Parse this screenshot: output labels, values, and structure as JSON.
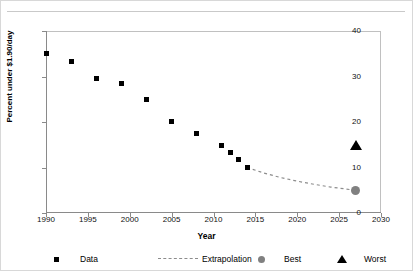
{
  "chart_data": {
    "type": "scatter",
    "title": "",
    "xlabel": "Year",
    "ylabel": "Percent under $1.90/day",
    "xlim": [
      1990,
      2030
    ],
    "ylim": [
      0,
      40
    ],
    "xticks": [
      1990,
      1995,
      2000,
      2005,
      2010,
      2015,
      2020,
      2025,
      2030
    ],
    "yticks": [
      0,
      10,
      20,
      30,
      40
    ],
    "grid": false,
    "legend_position": "bottom",
    "series": [
      {
        "name": "Data",
        "marker": "square",
        "color": "#000000",
        "points": [
          {
            "x": 1990,
            "y": 35.1
          },
          {
            "x": 1993,
            "y": 33.3
          },
          {
            "x": 1996,
            "y": 29.6
          },
          {
            "x": 1999,
            "y": 28.4
          },
          {
            "x": 2002,
            "y": 24.9
          },
          {
            "x": 2005,
            "y": 20.2
          },
          {
            "x": 2008,
            "y": 17.4
          },
          {
            "x": 2011,
            "y": 14.9
          },
          {
            "x": 2012,
            "y": 13.3
          },
          {
            "x": 2013,
            "y": 11.8
          },
          {
            "x": 2014,
            "y": 10.0
          }
        ]
      },
      {
        "name": "Extrapolation",
        "marker": "none",
        "linestyle": "dashed",
        "color": "#8c8c8c",
        "points": [
          {
            "x": 2014,
            "y": 10.0
          },
          {
            "x": 2016,
            "y": 8.8
          },
          {
            "x": 2018,
            "y": 7.8
          },
          {
            "x": 2020,
            "y": 7.0
          },
          {
            "x": 2022,
            "y": 6.3
          },
          {
            "x": 2024,
            "y": 5.7
          },
          {
            "x": 2027,
            "y": 5.0
          }
        ]
      },
      {
        "name": "Best",
        "marker": "circle",
        "color": "#808080",
        "points": [
          {
            "x": 2027,
            "y": 5.0
          }
        ]
      },
      {
        "name": "Worst",
        "marker": "triangle",
        "color": "#000000",
        "points": [
          {
            "x": 2027,
            "y": 15.0
          }
        ]
      }
    ],
    "legend": [
      "Data",
      "Extrapolation",
      "Best",
      "Worst"
    ]
  },
  "axes": {
    "y_title": "Percent under $1.90/day",
    "x_title": "Year",
    "y_tick_labels": [
      "0",
      "10",
      "20",
      "30",
      "40"
    ],
    "x_tick_labels": [
      "1990",
      "1995",
      "2000",
      "2005",
      "2010",
      "2015",
      "2020",
      "2025",
      "2030"
    ]
  },
  "legend": {
    "items": [
      {
        "label": "Data",
        "marker": "square-marker"
      },
      {
        "label": "Extrapolation",
        "marker": "dashed-line-marker"
      },
      {
        "label": "Best",
        "marker": "circle-marker"
      },
      {
        "label": "Worst",
        "marker": "triangle-marker"
      }
    ]
  }
}
